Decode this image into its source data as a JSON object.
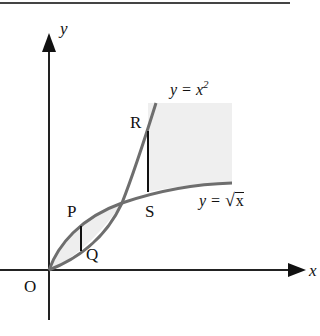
{
  "figure": {
    "type": "graph-of-two-curves",
    "background": "#ffffff",
    "ink_color": "#111111",
    "curve_color": "#6e6e6e",
    "shade_color": "#eeeeee",
    "axes": {
      "x_label": "x",
      "y_label": "y",
      "origin_label": "O"
    },
    "curves": [
      {
        "name": "parabola",
        "label_lhs": "y = x",
        "label_exp": "2",
        "equation": "y = x^2"
      },
      {
        "name": "root",
        "label_lhs": "y = ",
        "label_sqrt_symbol": "√",
        "label_arg": "x",
        "equation": "y = sqrt(x)"
      }
    ],
    "points": {
      "P": "P",
      "Q": "Q",
      "R": "R",
      "S": "S"
    }
  }
}
